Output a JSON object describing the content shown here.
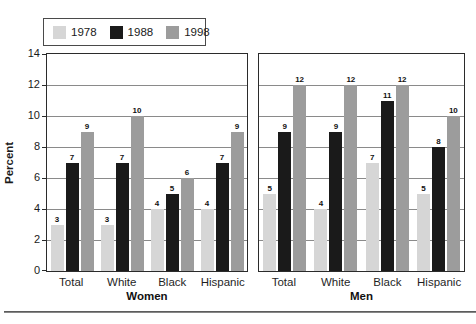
{
  "figure": {
    "ylabel": "Percent"
  },
  "legend": {
    "items": [
      {
        "label": "1978",
        "color": "#d6d6d6"
      },
      {
        "label": "1988",
        "color": "#1a1a1a"
      },
      {
        "label": "1998",
        "color": "#9c9c9c"
      }
    ]
  },
  "chart_data": {
    "type": "bar",
    "title": "",
    "ylabel": "Percent",
    "xlabel": "",
    "ylim": [
      0,
      14
    ],
    "yticks": [
      0,
      2,
      4,
      6,
      8,
      10,
      12,
      14
    ],
    "grid": true,
    "legend_position": "top-left",
    "series_names": [
      "1978",
      "1988",
      "1998"
    ],
    "series_colors": [
      "#d6d6d6",
      "#1a1a1a",
      "#9c9c9c"
    ],
    "value_labels": true,
    "panels": [
      {
        "title": "Women",
        "categories": [
          "Total",
          "White",
          "Black",
          "Hispanic"
        ],
        "series": [
          {
            "name": "1978",
            "values": [
              3,
              3,
              4,
              4
            ]
          },
          {
            "name": "1988",
            "values": [
              7,
              7,
              5,
              7
            ]
          },
          {
            "name": "1998",
            "values": [
              9,
              10,
              6,
              9
            ]
          }
        ]
      },
      {
        "title": "Men",
        "categories": [
          "Total",
          "White",
          "Black",
          "Hispanic"
        ],
        "series": [
          {
            "name": "1978",
            "values": [
              5,
              4,
              7,
              5
            ]
          },
          {
            "name": "1988",
            "values": [
              9,
              9,
              11,
              8
            ]
          },
          {
            "name": "1998",
            "values": [
              12,
              12,
              12,
              10
            ]
          }
        ]
      }
    ]
  }
}
